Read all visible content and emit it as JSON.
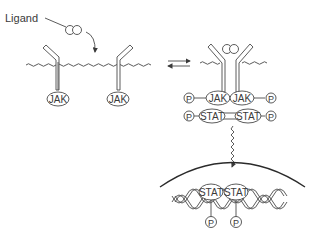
{
  "diagram": {
    "ligand_label": "Ligand",
    "left_state": {
      "description": "Unbound receptors in membrane",
      "jak_labels": [
        "JAK",
        "JAK"
      ]
    },
    "equilibrium_arrows": "reversible",
    "right_state": {
      "description": "Ligand-bound dimerized receptor complex",
      "jak_labels": [
        "JAK",
        "JAK"
      ],
      "jak_phospho": [
        "P",
        "P"
      ],
      "stat_labels": [
        "STAT",
        "STAT"
      ],
      "stat_phospho": [
        "P",
        "P"
      ]
    },
    "nucleus": {
      "description": "STAT dimer bound to DNA in nucleus",
      "stat_labels": [
        "STAT",
        "STAT"
      ],
      "phospho": [
        "P",
        "P"
      ]
    },
    "colors": {
      "line": "#4a4a4a",
      "background": "#ffffff"
    }
  }
}
